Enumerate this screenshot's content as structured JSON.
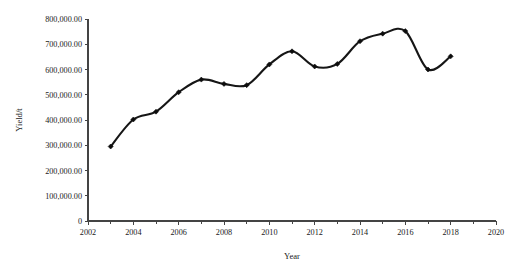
{
  "chart_data": {
    "type": "line",
    "title": "",
    "xlabel": "Year",
    "ylabel": "Yield/t",
    "xlim": [
      2002,
      2020
    ],
    "ylim": [
      0,
      800000
    ],
    "grid": false,
    "legend": "none",
    "x_tick_labels": [
      "2002",
      "2004",
      "2006",
      "2008",
      "2010",
      "2012",
      "2014",
      "2016",
      "2018",
      "2020"
    ],
    "x_tick_values": [
      2002,
      2004,
      2006,
      2008,
      2010,
      2012,
      2014,
      2016,
      2018,
      2020
    ],
    "x_minor_tick_values": [
      2003,
      2005,
      2007,
      2009,
      2011,
      2013,
      2015,
      2017,
      2019
    ],
    "y_tick_labels": [
      "0",
      "100,000.00",
      "200,000.00",
      "300,000.00",
      "400,000.00",
      "500,000.00",
      "600,000.00",
      "700,000.00",
      "800,000.00"
    ],
    "y_tick_values": [
      0,
      100000,
      200000,
      300000,
      400000,
      500000,
      600000,
      700000,
      800000
    ],
    "x": [
      2003,
      2004,
      2005,
      2006,
      2007,
      2008,
      2009,
      2010,
      2011,
      2012,
      2013,
      2014,
      2015,
      2016,
      2017,
      2018
    ],
    "values": [
      295000,
      402000,
      433000,
      510000,
      560000,
      543000,
      538000,
      620000,
      672000,
      612000,
      622000,
      712000,
      742000,
      752000,
      600000,
      652000
    ],
    "series": [
      {
        "name": "Yield",
        "marker": "diamond",
        "color": "#161616",
        "values": [
          295000,
          402000,
          433000,
          510000,
          560000,
          543000,
          538000,
          620000,
          672000,
          612000,
          622000,
          712000,
          742000,
          752000,
          600000,
          652000
        ]
      }
    ]
  },
  "figure": {
    "background_color": "#ffffff",
    "axis_color": "#444444",
    "line_color": "#161616",
    "marker_color": "#0d0d0d"
  }
}
